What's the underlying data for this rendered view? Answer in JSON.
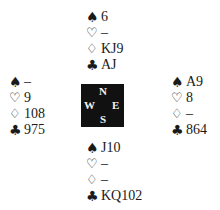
{
  "diagram_type": "bridge-deal",
  "suits": {
    "spade": "♠",
    "heart": "♡",
    "diamond": "♢",
    "club": "♣"
  },
  "compass": {
    "north": "N",
    "south": "S",
    "east": "E",
    "west": "W",
    "background": "#111111",
    "text_color": "#f2f2f2"
  },
  "hands": {
    "north": {
      "spades": "6",
      "hearts": "–",
      "diamonds": "KJ9",
      "clubs": "AJ"
    },
    "west": {
      "spades": "–",
      "hearts": "9",
      "diamonds": "108",
      "clubs": "975"
    },
    "east": {
      "spades": "A9",
      "hearts": "8",
      "diamonds": "–",
      "clubs": "864"
    },
    "south": {
      "spades": "J10",
      "hearts": "–",
      "diamonds": "–",
      "clubs": "KQ102"
    }
  }
}
